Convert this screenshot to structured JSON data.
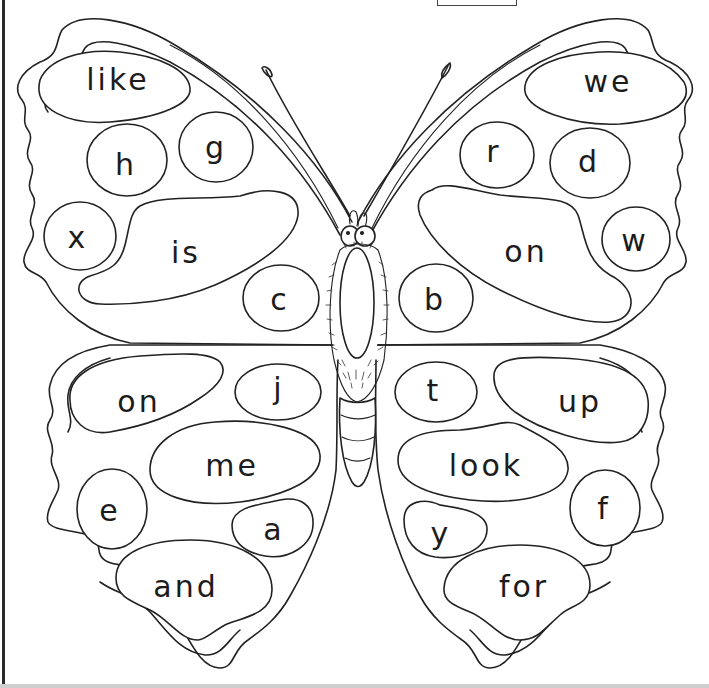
{
  "worksheet": {
    "subject": "butterfly",
    "line_color": "#222222",
    "background": "#ffffff",
    "wings": {
      "top_left": {
        "spots": [
          {
            "id": "tl1",
            "text": "like",
            "x": 118,
            "y": 80
          },
          {
            "id": "tl2",
            "text": "h",
            "x": 126,
            "y": 165
          },
          {
            "id": "tl3",
            "text": "g",
            "x": 216,
            "y": 148
          },
          {
            "id": "tl4",
            "text": "x",
            "x": 78,
            "y": 238
          },
          {
            "id": "tl5",
            "text": "is",
            "x": 186,
            "y": 253
          },
          {
            "id": "tl6",
            "text": "c",
            "x": 280,
            "y": 300
          }
        ]
      },
      "top_right": {
        "spots": [
          {
            "id": "tr1",
            "text": "we",
            "x": 608,
            "y": 82
          },
          {
            "id": "tr2",
            "text": "r",
            "x": 494,
            "y": 152
          },
          {
            "id": "tr3",
            "text": "d",
            "x": 589,
            "y": 162
          },
          {
            "id": "tr4",
            "text": "w",
            "x": 635,
            "y": 241
          },
          {
            "id": "tr5",
            "text": "on",
            "x": 526,
            "y": 252
          },
          {
            "id": "tr6",
            "text": "b",
            "x": 435,
            "y": 300
          }
        ]
      },
      "bottom_left": {
        "spots": [
          {
            "id": "bl1",
            "text": "on",
            "x": 139,
            "y": 402
          },
          {
            "id": "bl2",
            "text": "j",
            "x": 279,
            "y": 389
          },
          {
            "id": "bl3",
            "text": "me",
            "x": 232,
            "y": 466
          },
          {
            "id": "bl4",
            "text": "e",
            "x": 110,
            "y": 511
          },
          {
            "id": "bl5",
            "text": "a",
            "x": 274,
            "y": 530
          },
          {
            "id": "bl6",
            "text": "and",
            "x": 186,
            "y": 587
          }
        ]
      },
      "bottom_right": {
        "spots": [
          {
            "id": "br1",
            "text": "t",
            "x": 434,
            "y": 391
          },
          {
            "id": "br2",
            "text": "up",
            "x": 580,
            "y": 402
          },
          {
            "id": "br3",
            "text": "look",
            "x": 486,
            "y": 466
          },
          {
            "id": "br4",
            "text": "f",
            "x": 604,
            "y": 509
          },
          {
            "id": "br5",
            "text": "y",
            "x": 441,
            "y": 534
          },
          {
            "id": "br6",
            "text": "for",
            "x": 524,
            "y": 587
          }
        ]
      }
    }
  }
}
